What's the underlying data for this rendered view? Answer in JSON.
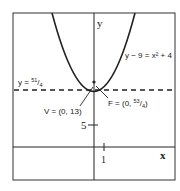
{
  "diagram": {
    "type": "parabola-graph",
    "axis_labels": {
      "x": "x",
      "y": "y"
    },
    "ticks": {
      "x_tick": "1",
      "y_tick": "5"
    },
    "equation": "y − 9 = x² + 4",
    "directrix": {
      "prefix": "y = ",
      "num": "51",
      "den": "4"
    },
    "vertex": {
      "label": "V = (0, 13)"
    },
    "focus": {
      "prefix": "F = (0, ",
      "num": "53",
      "den": "4",
      "suffix": ")"
    },
    "colors": {
      "stroke": "#222222",
      "background": "#ffffff"
    }
  }
}
